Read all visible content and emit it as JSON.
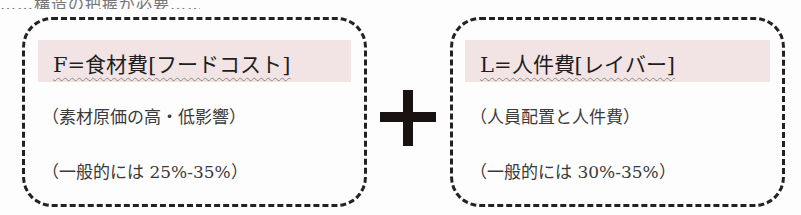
{
  "top_partial_text": "……構造の把握が必要……",
  "left_box": {
    "heading": "F=食材費[フードコスト]",
    "line1": "（素材原価の高・低影響）",
    "line2": "（一般的には 25%-35%）"
  },
  "operator": "+",
  "right_box": {
    "heading": "L=人件費[レイバー]",
    "line1": "（人員配置と人件費）",
    "line2": "（一般的には 30%-35%）"
  },
  "colors": {
    "heading_band": "#f2e4e4",
    "border": "#222222",
    "plus": "#1a1111"
  }
}
